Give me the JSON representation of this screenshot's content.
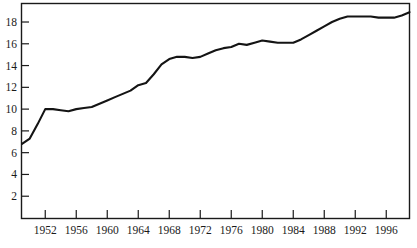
{
  "chart_data": {
    "type": "line",
    "title": "",
    "subtitle": "",
    "xlabel": "",
    "ylabel": "",
    "xlim": [
      1949,
      1999
    ],
    "ylim": [
      0,
      19.7
    ],
    "grid": false,
    "legend": null,
    "line_color": "#141414",
    "axis_color": "#1a1a1a",
    "background_color": "#ffffff",
    "xticks": [
      1952,
      1956,
      1960,
      1964,
      1968,
      1972,
      1976,
      1980,
      1984,
      1988,
      1992,
      1996
    ],
    "xtick_labels": [
      "1952",
      "1956",
      "1960",
      "1964",
      "1968",
      "1972",
      "1976",
      "1980",
      "1984",
      "1988",
      "1992",
      "1996"
    ],
    "yticks": [
      2,
      4,
      6,
      8,
      10,
      12,
      14,
      16,
      18
    ],
    "ytick_labels": [
      "2",
      "4",
      "6",
      "8",
      "10",
      "12",
      "14",
      "16",
      "18"
    ],
    "x": [
      1949,
      1950,
      1951,
      1952,
      1953,
      1954,
      1955,
      1956,
      1957,
      1958,
      1959,
      1960,
      1961,
      1962,
      1963,
      1964,
      1965,
      1966,
      1967,
      1968,
      1969,
      1970,
      1971,
      1972,
      1973,
      1974,
      1975,
      1976,
      1977,
      1978,
      1979,
      1980,
      1981,
      1982,
      1983,
      1984,
      1985,
      1986,
      1987,
      1988,
      1989,
      1990,
      1991,
      1992,
      1993,
      1994,
      1995,
      1996,
      1997,
      1998,
      1999
    ],
    "series": [
      {
        "name": "value",
        "values": [
          6.8,
          7.3,
          8.6,
          10.0,
          10.0,
          9.9,
          9.8,
          10.0,
          10.1,
          10.2,
          10.5,
          10.8,
          11.1,
          11.4,
          11.7,
          12.2,
          12.4,
          13.2,
          14.1,
          14.6,
          14.8,
          14.8,
          14.7,
          14.8,
          15.1,
          15.4,
          15.6,
          15.7,
          16.0,
          15.9,
          16.1,
          16.3,
          16.2,
          16.1,
          16.1,
          16.1,
          16.4,
          16.8,
          17.2,
          17.6,
          18.0,
          18.3,
          18.5,
          18.5,
          18.5,
          18.5,
          18.4,
          18.4,
          18.4,
          18.6,
          18.9
        ]
      }
    ]
  }
}
